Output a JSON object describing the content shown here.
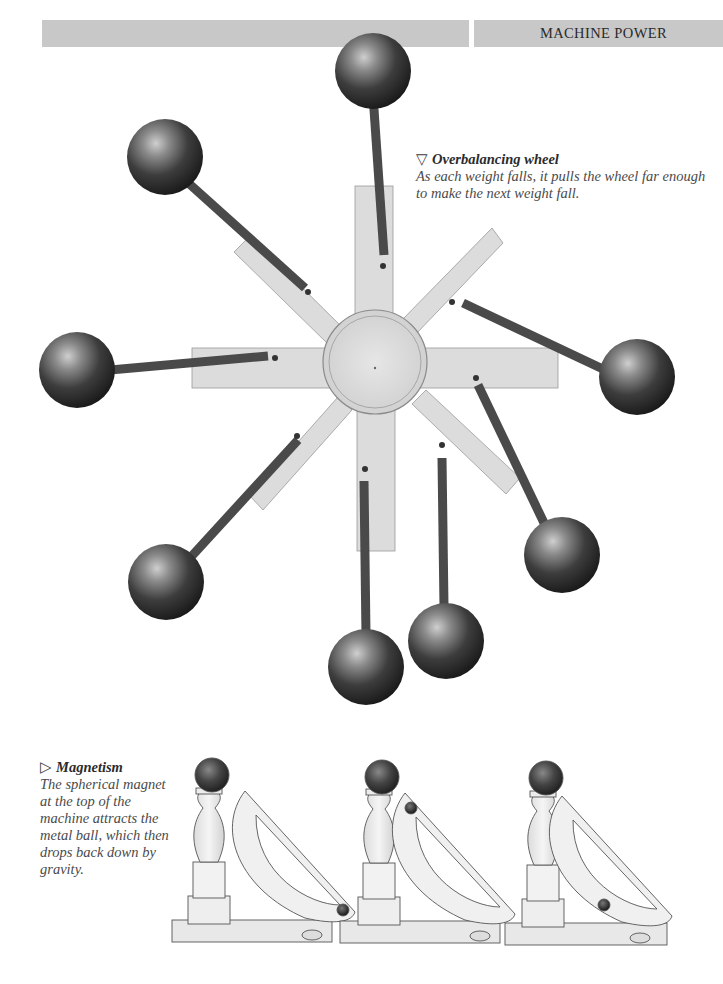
{
  "header": {
    "section_title": "MACHINE POWER",
    "bar_color": "#c8c8c8"
  },
  "figures": [
    {
      "id": "overbalancing-wheel",
      "marker": "▽",
      "title": "Overbalancing wheel",
      "caption": "As each weight falls, it pulls the wheel far enough to make the next weight fall.",
      "weights_count": 8,
      "spokes_count": 8
    },
    {
      "id": "magnetism",
      "marker": "▷",
      "title": "Magnetism",
      "caption": "The spherical magnet at the top of the machine attracts the metal ball, which then drops back down by gravity.",
      "machines_count": 3
    }
  ],
  "icons": {
    "down-triangle": "▽",
    "right-triangle": "▷"
  }
}
